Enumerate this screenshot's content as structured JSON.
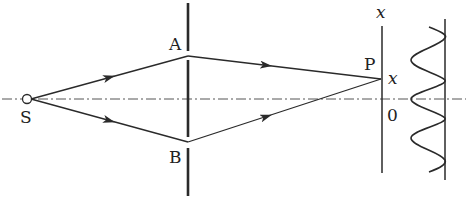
{
  "diagram": {
    "labels": {
      "source": "S",
      "slit_top": "A",
      "slit_bottom": "B",
      "point": "P",
      "screen_axis": "x",
      "point_coord": "x",
      "origin": "0"
    },
    "colors": {
      "line": "#2a2a2a",
      "axis_dash": "#555555",
      "background": "#ffffff"
    }
  }
}
